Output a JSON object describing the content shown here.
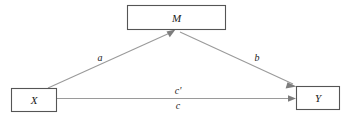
{
  "figure": {
    "type": "mediation-path-diagram",
    "title": "",
    "background_color": "#ffffff",
    "box_stroke_color": "#555555",
    "edge_color": "#9a9a9a",
    "text_color": "#1a1a1a"
  },
  "nodes": [
    {
      "id": "M",
      "label": "M",
      "role": "mediator",
      "x": 127,
      "y": 5,
      "width": 99,
      "height": 25
    },
    {
      "id": "X",
      "label": "X",
      "role": "independent-variable",
      "x": 11,
      "y": 88,
      "width": 46,
      "height": 24
    },
    {
      "id": "Y",
      "label": "Y",
      "role": "dependent-variable",
      "x": 296,
      "y": 86,
      "width": 44,
      "height": 24
    }
  ],
  "edges": [
    {
      "id": "a",
      "label": "a",
      "from": "X",
      "to": "M",
      "label_x": 100,
      "label_y": 61
    },
    {
      "id": "b",
      "label": "b",
      "from": "M",
      "to": "Y",
      "label_x": 257,
      "label_y": 61
    },
    {
      "id": "c-prime",
      "label": "c'",
      "from": "X",
      "to": "Y",
      "label_x": 178,
      "label_y": 93
    },
    {
      "id": "c",
      "label": "c",
      "from": "X",
      "to": "Y",
      "label_x": 178,
      "label_y": 108
    }
  ]
}
